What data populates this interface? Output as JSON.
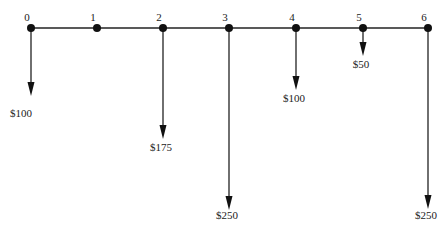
{
  "diagram": {
    "type": "cash-flow-timeline",
    "axis_y": 28,
    "periods": [
      {
        "label": "0",
        "x": 31,
        "cashflow": "$100",
        "arrow_end": 96,
        "label_y": 117
      },
      {
        "label": "1",
        "x": 97,
        "cashflow": null,
        "arrow_end": null,
        "label_y": null
      },
      {
        "label": "2",
        "x": 163,
        "cashflow": "$175",
        "arrow_end": 139,
        "label_y": 151
      },
      {
        "label": "3",
        "x": 229,
        "cashflow": "$250",
        "arrow_end": 210,
        "label_y": 219
      },
      {
        "label": "4",
        "x": 296,
        "cashflow": "$100",
        "arrow_end": 90,
        "label_y": 102
      },
      {
        "label": "5",
        "x": 363,
        "cashflow": "$50",
        "arrow_end": 56,
        "label_y": 68
      },
      {
        "label": "6",
        "x": 428,
        "cashflow": "$250",
        "arrow_end": 209,
        "label_y": 219
      }
    ]
  }
}
